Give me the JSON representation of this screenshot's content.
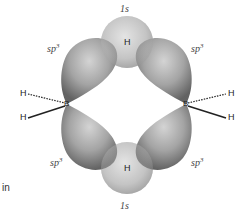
{
  "diagram": {
    "atoms": {
      "boron_left": "B",
      "boron_right": "B",
      "terminal_h_left_top": "H",
      "terminal_h_left_bottom": "H",
      "terminal_h_right_top": "H",
      "terminal_h_right_bottom": "H",
      "bridge_h_top": "H",
      "bridge_h_bottom": "H"
    },
    "orbital_labels": {
      "top_1s": "1s",
      "bottom_1s": "1s",
      "sp3_upper_left": "sp",
      "sp3_upper_right": "sp",
      "sp3_lower_left": "sp",
      "sp3_lower_right": "sp",
      "sp3_superscript": "3"
    },
    "side_text": "in",
    "colors": {
      "sphere": "#c8c8c8",
      "lobe": "#9a9a9a",
      "lobe_dark": "#555555",
      "bond": "#222222"
    }
  }
}
